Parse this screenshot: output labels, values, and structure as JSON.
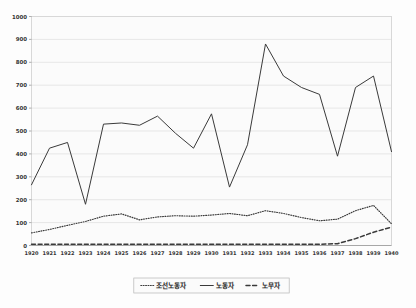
{
  "chart_data": {
    "type": "line",
    "title": "",
    "subtitle": "",
    "xlabel": "",
    "ylabel": "",
    "xlim": [
      1920,
      1940
    ],
    "ylim": [
      0,
      1000
    ],
    "grid": true,
    "legend_position": "bottom",
    "categories": [
      "1920",
      "1921",
      "1922",
      "1923",
      "1924",
      "1925",
      "1926",
      "1927",
      "1928",
      "1929",
      "1930",
      "1931",
      "1932",
      "1933",
      "1934",
      "1935",
      "1936",
      "1937",
      "1938",
      "1939",
      "1940"
    ],
    "ytick_labels": [
      "0",
      "100",
      "200",
      "300",
      "400",
      "500",
      "600",
      "700",
      "800",
      "900",
      "1000"
    ],
    "ytick_values": [
      0,
      100,
      200,
      300,
      400,
      500,
      600,
      700,
      800,
      900,
      1000
    ],
    "series": [
      {
        "name": "조선노동자",
        "style": "dotted",
        "color": "#3a3a3a",
        "values": [
          55,
          70,
          88,
          105,
          128,
          138,
          112,
          125,
          130,
          128,
          133,
          140,
          130,
          152,
          140,
          122,
          108,
          115,
          152,
          175,
          95
        ]
      },
      {
        "name": "노동자",
        "style": "solid",
        "color": "#3a3a3a",
        "values": [
          265,
          425,
          450,
          180,
          530,
          535,
          525,
          565,
          490,
          425,
          575,
          255,
          440,
          880,
          740,
          690,
          660,
          390,
          690,
          740,
          410
        ]
      },
      {
        "name": "노무자",
        "style": "dashed",
        "color": "#3a3a3a",
        "values": [
          5,
          5,
          5,
          5,
          5,
          5,
          5,
          5,
          5,
          5,
          5,
          5,
          5,
          5,
          5,
          5,
          5,
          8,
          30,
          58,
          80
        ]
      }
    ]
  },
  "legend": {
    "items": [
      {
        "label": "조선노동자",
        "style": "dotted"
      },
      {
        "label": "노동자",
        "style": "solid"
      },
      {
        "label": "노무자",
        "style": "dashed"
      }
    ]
  }
}
